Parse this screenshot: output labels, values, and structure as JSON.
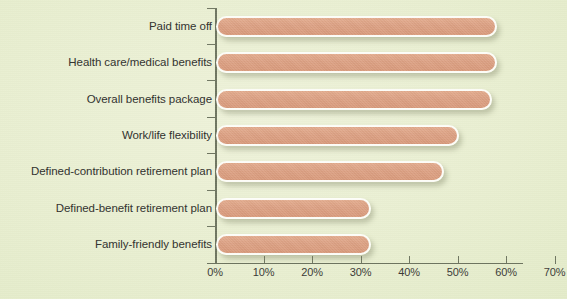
{
  "chart_data": {
    "type": "bar",
    "orientation": "horizontal",
    "title": "",
    "xlabel": "",
    "ylabel": "",
    "xlim": [
      0,
      70
    ],
    "grid": false,
    "legend": null,
    "categories": [
      "Paid time off",
      "Health care/medical benefits",
      "Overall benefits package",
      "Work/life flexibility",
      "Defined-contribution retirement plan",
      "Defined-benefit retirement plan",
      "Family-friendly benefits"
    ],
    "values": [
      58,
      58,
      57,
      50,
      47,
      32,
      32
    ],
    "value_suffix": "%",
    "xticks": [
      0,
      10,
      20,
      30,
      40,
      50,
      60,
      70
    ],
    "xtick_labels": [
      "0%",
      "10%",
      "20%",
      "30%",
      "40%",
      "50%",
      "60%",
      "70%"
    ],
    "series": [
      {
        "name": "Percent of respondents",
        "values": [
          58,
          58,
          57,
          50,
          47,
          32,
          32
        ]
      }
    ]
  },
  "colors": {
    "background": "#eaf0d2",
    "bar_fill": "#dca083",
    "bar_outline": "#fdfdf8",
    "axis": "#6e7560",
    "label_text": "#2f2f2c"
  }
}
